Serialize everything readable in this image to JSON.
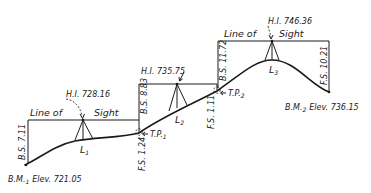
{
  "figure": {
    "type": "differential-leveling-diagram",
    "line_of_sight_label_left": "Line of",
    "line_of_sight_label_right": "Sight"
  },
  "benchmarks": [
    {
      "id": "bm1",
      "label": "B.M.",
      "sub": "1",
      "elev_label": "Elev. 721.05",
      "elevation": 721.05
    },
    {
      "id": "bm2",
      "label": "B.M.",
      "sub": "2",
      "elev_label": "Elev. 736.15",
      "elevation": 736.15
    }
  ],
  "setups": [
    {
      "id": "L1",
      "label": "L",
      "sub": "1",
      "hi_label": "H.I. 728.16",
      "hi": 728.16,
      "bs_label": "B.S. 7.11",
      "bs": 7.11,
      "fs_label": "F.S. 1.24",
      "fs": 1.24
    },
    {
      "id": "L2",
      "label": "L",
      "sub": "2",
      "hi_label": "H.I. 735.75",
      "hi": 735.75,
      "bs_label": "B.S. 8.83",
      "bs": 8.83,
      "fs_label": "F.S. 1.11",
      "fs": 1.11
    },
    {
      "id": "L3",
      "label": "L",
      "sub": "3",
      "hi_label": "H.I. 746.36",
      "hi": 746.36,
      "bs_label": "B.S. 11.72",
      "bs": 11.72,
      "fs_label": "F.S. 10.21",
      "fs": 10.21
    }
  ],
  "turning_points": [
    {
      "id": "tp1",
      "label": "T.P.",
      "sub": "1"
    },
    {
      "id": "tp2",
      "label": "T.P.",
      "sub": "2"
    }
  ]
}
